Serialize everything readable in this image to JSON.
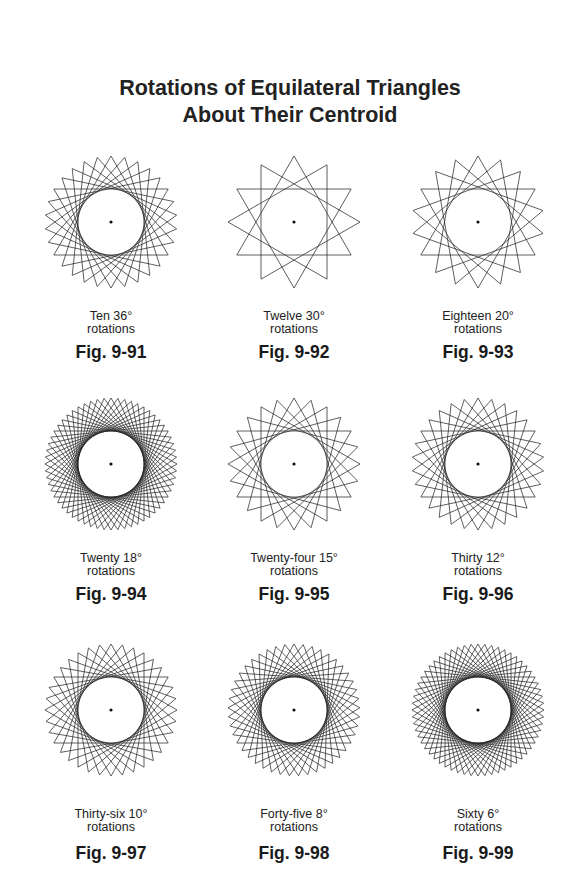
{
  "title": {
    "line1": "Rotations of Equilateral Triangles",
    "line2": "About Their Centroid"
  },
  "figures": [
    {
      "caption1": "Ten 36°",
      "caption2": "rotations",
      "label": "Fig. 9-91",
      "count": 10,
      "step_deg": 36
    },
    {
      "caption1": "Twelve 30°",
      "caption2": "rotations",
      "label": "Fig. 9-92",
      "count": 12,
      "step_deg": 30
    },
    {
      "caption1": "Eighteen 20°",
      "caption2": "rotations",
      "label": "Fig. 9-93",
      "count": 18,
      "step_deg": 20
    },
    {
      "caption1": "Twenty 18°",
      "caption2": "rotations",
      "label": "Fig. 9-94",
      "count": 20,
      "step_deg": 18
    },
    {
      "caption1": "Twenty-four 15°",
      "caption2": "rotations",
      "label": "Fig. 9-95",
      "count": 24,
      "step_deg": 15
    },
    {
      "caption1": "Thirty 12°",
      "caption2": "rotations",
      "label": "Fig. 9-96",
      "count": 30,
      "step_deg": 12
    },
    {
      "caption1": "Thirty-six 10°",
      "caption2": "rotations",
      "label": "Fig. 9-97",
      "count": 36,
      "step_deg": 10
    },
    {
      "caption1": "Forty-five 8°",
      "caption2": "rotations",
      "label": "Fig. 9-98",
      "count": 45,
      "step_deg": 8
    },
    {
      "caption1": "Sixty 6°",
      "caption2": "rotations",
      "label": "Fig. 9-99",
      "count": 60,
      "step_deg": 6
    }
  ],
  "colors": {
    "line": "#2a2a2a",
    "background": "#ffffff"
  }
}
